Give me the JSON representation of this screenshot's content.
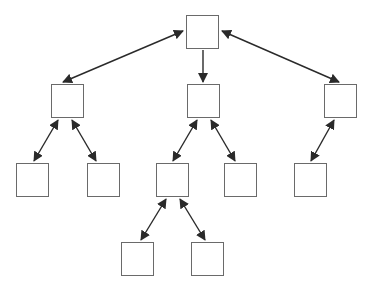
{
  "diagram": {
    "type": "tree",
    "colors": {
      "node_border": "#6a6a6a",
      "edge": "#2a2a2a",
      "background": "#ffffff"
    },
    "nodes": [
      {
        "id": "root",
        "x": 186,
        "y": 15,
        "w": 33,
        "h": 34
      },
      {
        "id": "left",
        "x": 51,
        "y": 84,
        "w": 33,
        "h": 34
      },
      {
        "id": "middle",
        "x": 187,
        "y": 84,
        "w": 33,
        "h": 34
      },
      {
        "id": "right",
        "x": 324,
        "y": 84,
        "w": 33,
        "h": 34
      },
      {
        "id": "left-left",
        "x": 16,
        "y": 163,
        "w": 33,
        "h": 34
      },
      {
        "id": "left-right",
        "x": 87,
        "y": 163,
        "w": 33,
        "h": 34
      },
      {
        "id": "middle-left",
        "x": 156,
        "y": 163,
        "w": 33,
        "h": 34
      },
      {
        "id": "middle-right",
        "x": 224,
        "y": 163,
        "w": 33,
        "h": 34
      },
      {
        "id": "right-left",
        "x": 294,
        "y": 163,
        "w": 33,
        "h": 34
      },
      {
        "id": "middle-left-left",
        "x": 121,
        "y": 242,
        "w": 33,
        "h": 34
      },
      {
        "id": "middle-left-right",
        "x": 191,
        "y": 242,
        "w": 33,
        "h": 34
      }
    ],
    "edges": [
      {
        "from": "root",
        "to": "left",
        "x1": 183,
        "y1": 31,
        "x2": 63,
        "y2": 82,
        "start_arrow": true,
        "end_arrow": true
      },
      {
        "from": "root",
        "to": "middle",
        "x1": 203,
        "y1": 50,
        "x2": 203,
        "y2": 82,
        "start_arrow": false,
        "end_arrow": true
      },
      {
        "from": "root",
        "to": "right",
        "x1": 222,
        "y1": 31,
        "x2": 339,
        "y2": 82,
        "start_arrow": true,
        "end_arrow": true
      },
      {
        "from": "left",
        "to": "left-left",
        "x1": 58,
        "y1": 120,
        "x2": 34,
        "y2": 161,
        "start_arrow": true,
        "end_arrow": true
      },
      {
        "from": "left",
        "to": "left-right",
        "x1": 72,
        "y1": 120,
        "x2": 96,
        "y2": 161,
        "start_arrow": true,
        "end_arrow": true
      },
      {
        "from": "middle",
        "to": "middle-left",
        "x1": 197,
        "y1": 120,
        "x2": 173,
        "y2": 161,
        "start_arrow": true,
        "end_arrow": true
      },
      {
        "from": "middle",
        "to": "middle-right",
        "x1": 211,
        "y1": 120,
        "x2": 235,
        "y2": 161,
        "start_arrow": true,
        "end_arrow": true
      },
      {
        "from": "right",
        "to": "right-left",
        "x1": 334,
        "y1": 120,
        "x2": 311,
        "y2": 161,
        "start_arrow": true,
        "end_arrow": true
      },
      {
        "from": "middle-left",
        "to": "middle-left-left",
        "x1": 166,
        "y1": 199,
        "x2": 141,
        "y2": 240,
        "start_arrow": true,
        "end_arrow": true
      },
      {
        "from": "middle-left",
        "to": "middle-left-right",
        "x1": 180,
        "y1": 199,
        "x2": 205,
        "y2": 240,
        "start_arrow": true,
        "end_arrow": true
      }
    ]
  }
}
